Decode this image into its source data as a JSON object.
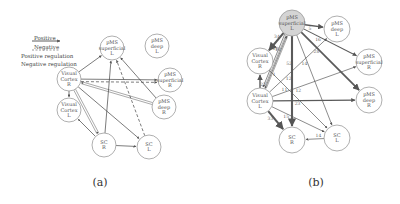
{
  "legend": {
    "items": [
      {
        "label": "Positive",
        "style": "solid"
      },
      {
        "label": "Negative",
        "style": "dashed"
      },
      {
        "label": "Positive regulation",
        "style": "double"
      },
      {
        "label": "Negative regulation",
        "style": "double-dashed"
      }
    ]
  },
  "panels": [
    {
      "caption": "(a)",
      "nodes": [
        {
          "id": "pms_sup_l",
          "lines": [
            "pMS",
            "superficial",
            "L"
          ],
          "highlight": false
        },
        {
          "id": "pms_deep_l",
          "lines": [
            "pMS",
            "deep",
            "L"
          ],
          "highlight": false
        },
        {
          "id": "pms_sup_r",
          "lines": [
            "pMS",
            "superficial",
            "R"
          ],
          "highlight": false
        },
        {
          "id": "pms_deep_r",
          "lines": [
            "pMS",
            "deep",
            "R"
          ],
          "highlight": false
        },
        {
          "id": "vc_r",
          "lines": [
            "Visual",
            "Cortex",
            "R"
          ],
          "highlight": false
        },
        {
          "id": "vc_l",
          "lines": [
            "Visual",
            "Cortex",
            "L"
          ],
          "highlight": false
        },
        {
          "id": "sc_r",
          "lines": [
            "SC",
            "R"
          ],
          "highlight": false
        },
        {
          "id": "sc_l",
          "lines": [
            "SC",
            "L"
          ],
          "highlight": false
        }
      ],
      "edges": [
        {
          "from": "vc_r",
          "to": "pms_sup_l",
          "type": "solid"
        },
        {
          "from": "vc_r",
          "to": "pms_sup_r",
          "type": "solid"
        },
        {
          "from": "pms_deep_r",
          "to": "vc_r",
          "type": "double"
        },
        {
          "from": "vc_r",
          "to": "vc_l",
          "type": "solid"
        },
        {
          "from": "vc_r",
          "to": "sc_r",
          "type": "double"
        },
        {
          "from": "vc_r",
          "to": "sc_l",
          "type": "solid"
        },
        {
          "from": "sc_r",
          "to": "pms_sup_l",
          "type": "solid"
        },
        {
          "from": "sc_r",
          "to": "sc_l",
          "type": "solid"
        },
        {
          "from": "sc_r",
          "to": "vc_l",
          "type": "solid"
        },
        {
          "from": "sc_l",
          "to": "pms_sup_l",
          "type": "dashed"
        },
        {
          "from": "pms_deep_r",
          "to": "pms_sup_l",
          "type": "solid"
        },
        {
          "from": "vc_r",
          "to": "pms_sup_r",
          "type": "dashed"
        }
      ]
    },
    {
      "caption": "(b)",
      "nodes": [
        {
          "id": "pms_sup_l",
          "lines": [
            "pMS",
            "superficial",
            "L"
          ],
          "highlight": true
        },
        {
          "id": "pms_deep_l",
          "lines": [
            "pMS",
            "deep",
            "L"
          ],
          "highlight": false
        },
        {
          "id": "pms_sup_r",
          "lines": [
            "pMS",
            "superficial",
            "R"
          ],
          "highlight": false
        },
        {
          "id": "pms_deep_r",
          "lines": [
            "pMS",
            "deep",
            "R"
          ],
          "highlight": false
        },
        {
          "id": "vc_r",
          "lines": [
            "Visual",
            "Cortex",
            "R"
          ],
          "highlight": false
        },
        {
          "id": "vc_l",
          "lines": [
            "Visual",
            "Cortex",
            "L"
          ],
          "highlight": false
        },
        {
          "id": "sc_r",
          "lines": [
            "SC",
            "R"
          ],
          "highlight": false
        },
        {
          "id": "sc_l",
          "lines": [
            "SC",
            "L"
          ],
          "highlight": false
        }
      ],
      "edges": [
        {
          "from": "pms_sup_l",
          "to": "pms_deep_l",
          "label": "5",
          "weight": 2
        },
        {
          "from": "pms_sup_l",
          "to": "vc_r",
          "label": "34",
          "weight": 3
        },
        {
          "from": "pms_sup_l",
          "to": "pms_sup_r",
          "label": "16",
          "weight": 1.5
        },
        {
          "from": "pms_sup_l",
          "to": "pms_deep_r",
          "label": "28",
          "weight": 2.5
        },
        {
          "from": "pms_sup_l",
          "to": "sc_r",
          "label": "52",
          "weight": 3
        },
        {
          "from": "pms_sup_l",
          "to": "vc_l",
          "label": "13",
          "weight": 1,
          "type": "double"
        },
        {
          "from": "pms_sup_l",
          "to": "vc_l",
          "label": "18",
          "weight": 1
        },
        {
          "from": "pms_sup_l",
          "to": "sc_l",
          "label": "14",
          "weight": 1
        },
        {
          "from": "vc_l",
          "to": "pms_deep_l",
          "label": "12",
          "weight": 1
        },
        {
          "from": "vc_l",
          "to": "pms_sup_l",
          "label": "1",
          "weight": 1
        },
        {
          "from": "vc_l",
          "to": "vc_r",
          "label": "27",
          "weight": 2
        },
        {
          "from": "vc_l",
          "to": "pms_sup_r",
          "label": "12",
          "weight": 1
        },
        {
          "from": "vc_l",
          "to": "pms_deep_r",
          "label": "23",
          "weight": 1.5
        },
        {
          "from": "vc_l",
          "to": "sc_r",
          "label": "33",
          "weight": 3
        },
        {
          "from": "vc_l",
          "to": "sc_l",
          "label": "15",
          "weight": 1
        },
        {
          "from": "vc_r",
          "to": "sc_l",
          "label": "11",
          "weight": 1
        },
        {
          "from": "sc_l",
          "to": "sc_r",
          "label": "14",
          "weight": 1
        }
      ]
    }
  ]
}
